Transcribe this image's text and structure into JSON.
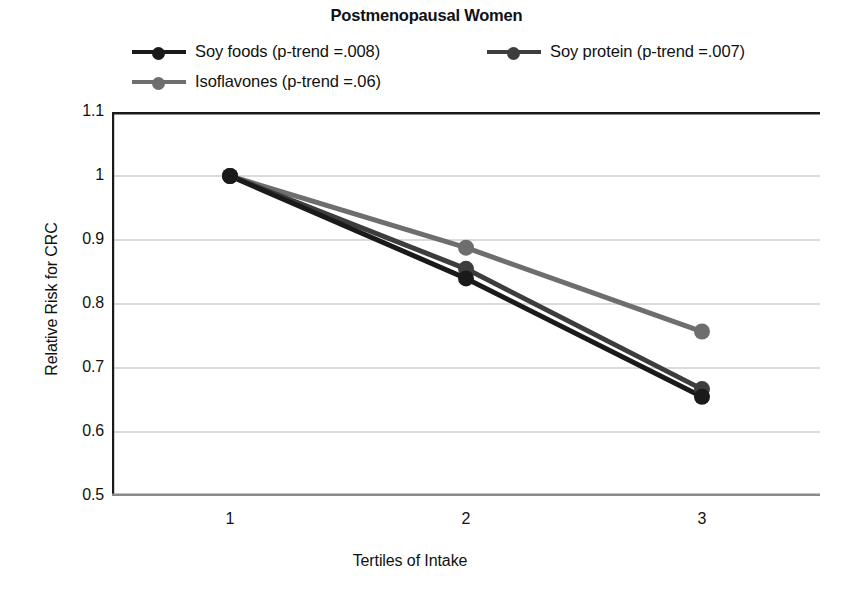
{
  "chart_data": {
    "type": "line",
    "title": "Postmenopausal Women",
    "xlabel": "Tertiles of Intake",
    "ylabel": "Relative Risk for CRC",
    "x": [
      1,
      2,
      3
    ],
    "categories": [
      "1",
      "2",
      "3"
    ],
    "xtick_labels": [
      "1",
      "2",
      "3"
    ],
    "ytick_labels": [
      "1.1",
      "1",
      "0.9",
      "0.8",
      "0.7",
      "0.6",
      "0.5"
    ],
    "ytick_values": [
      1.1,
      1.0,
      0.9,
      0.8,
      0.7,
      0.6,
      0.5
    ],
    "ylim": [
      0.5,
      1.1
    ],
    "xlim": [
      0.5,
      3.5
    ],
    "grid": "horizontal",
    "legend_position": "top",
    "series": [
      {
        "name": "Soy foods (p-trend =.008)",
        "short_name": "Soy foods",
        "p_trend": ".008",
        "color": "#1a1a1a",
        "values": [
          1.0,
          0.84,
          0.655
        ]
      },
      {
        "name": "Soy protein (p-trend =.007)",
        "short_name": "Soy protein",
        "p_trend": ".007",
        "color": "#3d3d3d",
        "values": [
          1.0,
          0.855,
          0.667
        ]
      },
      {
        "name": "Isoflavones (p-trend =.06)",
        "short_name": "Isoflavones",
        "p_trend": ".06",
        "color": "#6e6e6e",
        "values": [
          1.0,
          0.888,
          0.757
        ]
      }
    ]
  },
  "colors": {
    "axis": "#1a1a1a",
    "grid": "#b8b8b8",
    "text": "#111111",
    "background": "#ffffff"
  }
}
